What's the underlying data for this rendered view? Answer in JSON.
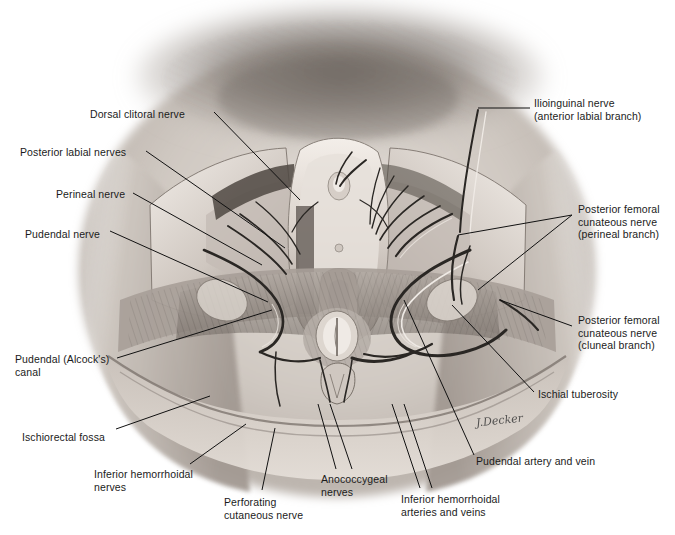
{
  "figure": {
    "artist_signature": "J.Decker",
    "style": "grayscale medical illustration"
  },
  "labels": {
    "left": [
      {
        "id": "dorsal-clitoral-nerve",
        "text": "Dorsal clitoral nerve",
        "x": 90,
        "y": 108,
        "align": "left"
      },
      {
        "id": "posterior-labial-nerves",
        "text": "Posterior labial nerves",
        "x": 20,
        "y": 146,
        "align": "left"
      },
      {
        "id": "perineal-nerve",
        "text": "Perineal nerve",
        "x": 56,
        "y": 188,
        "align": "left"
      },
      {
        "id": "pudendal-nerve",
        "text": "Pudendal nerve",
        "x": 25,
        "y": 228,
        "align": "left"
      },
      {
        "id": "pudendal-alcocks-canal",
        "text": "Pudendal (Alcock's)\ncanal",
        "x": 15,
        "y": 353,
        "align": "left"
      },
      {
        "id": "ischiorectal-fossa",
        "text": "Ischiorectal fossa",
        "x": 22,
        "y": 431,
        "align": "left"
      }
    ],
    "right": [
      {
        "id": "ilioinguinal-nerve",
        "text": "Ilioinguinal nerve\n(anterior labial branch)",
        "x": 534,
        "y": 97,
        "align": "left"
      },
      {
        "id": "posterior-femoral-cutaneous-perineal",
        "text": "Posterior femoral\ncunateous nerve\n(perineal branch)",
        "x": 578,
        "y": 203,
        "align": "left"
      },
      {
        "id": "posterior-femoral-cutaneous-cluneal",
        "text": "Posterior femoral\ncunateous nerve\n(cluneal branch)",
        "x": 578,
        "y": 314,
        "align": "left"
      },
      {
        "id": "ischial-tuberosity",
        "text": "Ischial tuberosity",
        "x": 538,
        "y": 388,
        "align": "left"
      },
      {
        "id": "pudendal-artery-and-vein",
        "text": "Pudendal artery and vein",
        "x": 476,
        "y": 455,
        "align": "left"
      }
    ],
    "bottom": [
      {
        "id": "inferior-hemorrhoidal-nerves",
        "text": "Inferior hemorrhoidal\nnerves",
        "x": 94,
        "y": 468,
        "align": "left"
      },
      {
        "id": "perforating-cutaneous-nerve",
        "text": "Perforating\ncutaneous nerve",
        "x": 224,
        "y": 496,
        "align": "left"
      },
      {
        "id": "anococcygeal-nerves",
        "text": "Anococcygeal\nnerves",
        "x": 321,
        "y": 473,
        "align": "left"
      },
      {
        "id": "inferior-hemorrhoidal-arteries-veins",
        "text": "Inferior hemorrhoidal\narteries and veins",
        "x": 401,
        "y": 493,
        "align": "left"
      }
    ]
  },
  "leaders": [
    {
      "id": "leader-dorsal-clitoral-nerve",
      "points": "214,112 300,200"
    },
    {
      "id": "leader-posterior-labial-nerves",
      "points": "146,151 285,248"
    },
    {
      "id": "leader-perineal-nerve",
      "points": "133,193 262,265"
    },
    {
      "id": "leader-pudendal-nerve",
      "points": "110,231 268,302"
    },
    {
      "id": "leader-pudendal-canal",
      "points": "117,358 272,310"
    },
    {
      "id": "leader-ischiorectal-fossa",
      "points": "116,429 210,396"
    },
    {
      "id": "leader-inferior-hemorrhoidal-nerves",
      "points": "190,464 246,424"
    },
    {
      "id": "leader-perforating-cutaneous-nerve",
      "points": "262,490 275,428"
    },
    {
      "id": "leader-anococcygeal-nerves-a",
      "points": "336,469 318,404"
    },
    {
      "id": "leader-anococcygeal-nerves-b",
      "points": "352,469 330,404"
    },
    {
      "id": "leader-inferior-hemorrhoidal-arteries-a",
      "points": "420,488 392,404"
    },
    {
      "id": "leader-inferior-hemorrhoidal-arteries-b",
      "points": "432,488 404,404"
    },
    {
      "id": "leader-ilioinguinal-nerve",
      "points": "530,108 478,108"
    },
    {
      "id": "leader-pf-cutaneous-perineal-a",
      "points": "572,215 458,235"
    },
    {
      "id": "leader-pf-cutaneous-perineal-b",
      "points": "572,215 478,290"
    },
    {
      "id": "leader-pf-cutaneous-cluneal",
      "points": "572,326 500,300"
    },
    {
      "id": "leader-ischial-tuberosity",
      "points": "534,392 452,305"
    },
    {
      "id": "leader-pudendal-artery-vein",
      "points": "474,455 404,300"
    }
  ],
  "colors": {
    "ink": "#1b1b1b",
    "leader": "#111111",
    "skin_light": "#d8d2cc",
    "skin_mid": "#b5aca5",
    "skin_dark": "#8d847d",
    "muscle": "#9c948d",
    "muscle_dark": "#6d655f",
    "vessel_dark": "#2a2724",
    "highlight": "#f1ece7",
    "background": "#ffffff"
  }
}
